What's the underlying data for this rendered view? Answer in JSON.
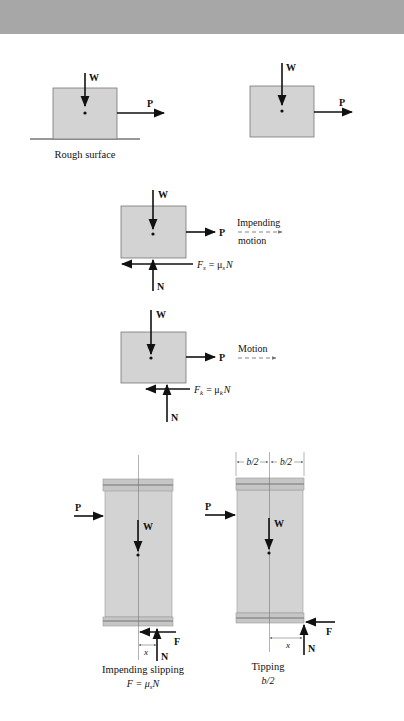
{
  "colors": {
    "band": "#a7a7a7",
    "block_fill": "#d3d3d3",
    "block_stroke": "#777777",
    "cap_fill": "#c6c6c6",
    "cap_stripe": "#8f8f8f",
    "ink": "#111111",
    "dash_arrow": "#777777"
  },
  "panels": {
    "rough_surface": {
      "weight_label": "W",
      "push_label": "P",
      "caption": "Rough surface"
    },
    "free_block": {
      "weight_label": "W",
      "push_label": "P"
    },
    "static_fbd": {
      "weight_label": "W",
      "push_label": "P",
      "normal_label": "N",
      "friction_label": "F",
      "friction_sub": "s",
      "friction_eq": "= μ",
      "friction_eq_sub": "s",
      "friction_eq_tail": "N",
      "motion_label_1": "Impending",
      "motion_label_2": "motion"
    },
    "kinetic_fbd": {
      "weight_label": "W",
      "push_label": "P",
      "normal_label": "N",
      "friction_label": "F",
      "friction_sub": "k",
      "friction_eq": "= μ",
      "friction_eq_sub": "k",
      "friction_eq_tail": "N",
      "motion_label": "Motion"
    },
    "slipping": {
      "push_label": "P",
      "weight_label": "W",
      "friction_label": "F",
      "normal_label": "N",
      "x_label": "x",
      "caption_1": "Impending slipping",
      "caption_2": "F = μ",
      "caption_2_sub": "s",
      "caption_2_tail": "N"
    },
    "tipping": {
      "push_label": "P",
      "weight_label": "W",
      "friction_label": "F",
      "normal_label": "N",
      "x_label": "x",
      "half_width_label_left": "b/2",
      "half_width_label_right": "b/2",
      "caption_1": "Tipping",
      "caption_2": "b/2"
    }
  }
}
